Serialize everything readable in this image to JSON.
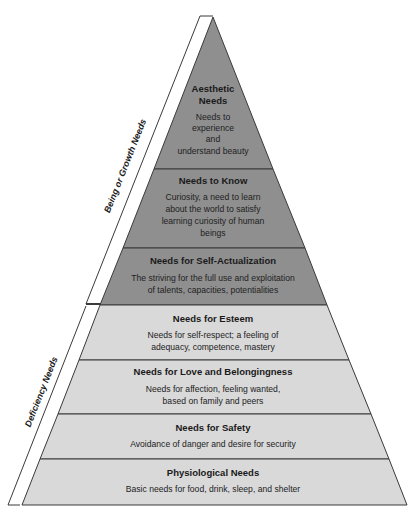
{
  "diagram": {
    "type": "pyramid",
    "colors": {
      "growth_fill": "#8f8f8f",
      "deficiency_fill": "#d9d9d9",
      "stroke": "#3a3a3a",
      "text": "#1a1a1a"
    },
    "side_labels": {
      "growth": "Being or Growth Needs",
      "deficiency": "Deficiency Needs"
    },
    "levels": [
      {
        "title_lines": [
          "Aesthetic",
          "Needs"
        ],
        "desc_lines": [
          "Needs to",
          "experience",
          "and",
          "understand beauty"
        ],
        "group": "growth"
      },
      {
        "title_lines": [
          "Needs to Know"
        ],
        "desc_lines": [
          "Curiosity, a need to learn",
          "about the world to satisfy",
          "learning curiosity of human",
          "beings"
        ],
        "group": "growth"
      },
      {
        "title_lines": [
          "Needs for Self-Actualization"
        ],
        "desc_lines": [
          "The striving for the full use and exploitation",
          "of talents, capacities, potentialities"
        ],
        "group": "growth"
      },
      {
        "title_lines": [
          "Needs for Esteem"
        ],
        "desc_lines": [
          "Needs for self-respect; a feeling of",
          "adequacy, competence, mastery"
        ],
        "group": "deficiency"
      },
      {
        "title_lines": [
          "Needs for Love and Belongingness"
        ],
        "desc_lines": [
          "Needs for affection, feeling wanted,",
          "based on family and peers"
        ],
        "group": "deficiency"
      },
      {
        "title_lines": [
          "Needs for Safety"
        ],
        "desc_lines": [
          "Avoidance of danger and desire for security"
        ],
        "group": "deficiency"
      },
      {
        "title_lines": [
          "Physiological Needs"
        ],
        "desc_lines": [
          "Basic needs for food, drink, sleep, and shelter"
        ],
        "group": "deficiency"
      }
    ]
  }
}
